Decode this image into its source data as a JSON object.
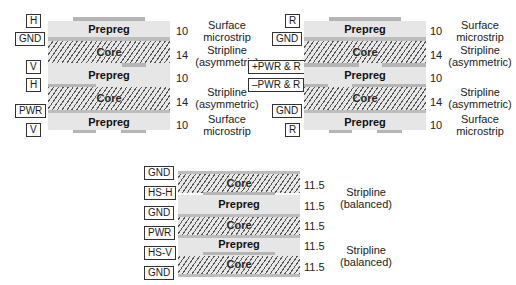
{
  "stackups": [
    {
      "id": "left",
      "signal_labels": [
        "H",
        "GND",
        "V",
        "H",
        "PWR",
        "V"
      ],
      "layers": [
        {
          "type": "Prepreg",
          "thickness": "10",
          "description": "Surface microstrip"
        },
        {
          "type": "Core",
          "thickness": "14",
          "description": "Stripline (asymmetric)"
        },
        {
          "type": "Prepreg",
          "thickness": "10",
          "description": ""
        },
        {
          "type": "Core",
          "thickness": "14",
          "description": "Stripline (asymmetric)"
        },
        {
          "type": "Prepreg",
          "thickness": "10",
          "description": "Surface microstrip"
        }
      ]
    },
    {
      "id": "right",
      "signal_labels": [
        "R",
        "GND",
        "+PWR & R",
        "–PWR & R",
        "GND",
        "R"
      ],
      "layers": [
        {
          "type": "Prepreg",
          "thickness": "10",
          "description": "Surface microstrip"
        },
        {
          "type": "Core",
          "thickness": "14",
          "description": "Stripline (asymmetric)"
        },
        {
          "type": "Prepreg",
          "thickness": "10",
          "description": ""
        },
        {
          "type": "Core",
          "thickness": "14",
          "description": "Stripline (asymmetric)"
        },
        {
          "type": "Prepreg",
          "thickness": "10",
          "description": "Surface microstrip"
        }
      ]
    },
    {
      "id": "bottom",
      "signal_labels": [
        "GND",
        "HS-H",
        "GND",
        "PWR",
        "HS-V",
        "GND"
      ],
      "layers": [
        {
          "type": "Core",
          "thickness": "11.5"
        },
        {
          "type": "Prepreg",
          "thickness": "11.5"
        },
        {
          "type": "Core",
          "thickness": "11.5"
        },
        {
          "type": "Prepreg",
          "thickness": "11.5"
        },
        {
          "type": "Core",
          "thickness": "11.5"
        }
      ],
      "descriptions": [
        "Stripline (balanced)",
        "Stripline (balanced)"
      ]
    }
  ],
  "text": {
    "surface": "Surface",
    "microstrip": "microstrip",
    "stripline": "Stripline",
    "asymmetric": "(asymmetric)",
    "balanced": "(balanced)"
  }
}
